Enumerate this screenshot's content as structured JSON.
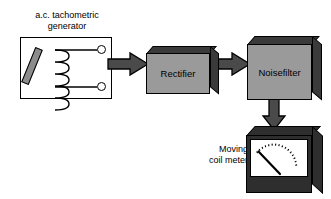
{
  "diagram": {
    "colors": {
      "block_fill": "#9a9a9a",
      "block_shadow": "#3a3a3a",
      "arrow_fill": "#4a4a4a",
      "outline": "#000000",
      "page_background": "#ffffff",
      "meter_bezel": "#2e2e2e",
      "rotor_fill": "#8c8c8c"
    },
    "nodes": [
      {
        "id": "generator",
        "label": "a.c. tachometric\ngenerator",
        "label_position": "above",
        "shape": "rectangle-outline",
        "contents": [
          "rotor-magnet",
          "coil-winding",
          "terminal-top",
          "terminal-bottom"
        ]
      },
      {
        "id": "rectifier",
        "label": "Rectifier",
        "shape": "block-3d"
      },
      {
        "id": "noise-filter",
        "label": "Noise\nfilter",
        "shape": "block-3d"
      },
      {
        "id": "moving-coil-meter",
        "label": "Moving\ncoil meter",
        "label_position": "left",
        "shape": "meter-3d",
        "scale_ticks": 21,
        "needle_value_fraction": 0.18
      }
    ],
    "connections": [
      {
        "from": "generator",
        "to": "rectifier",
        "direction": "right",
        "style": "block-arrow"
      },
      {
        "from": "rectifier",
        "to": "noise-filter",
        "direction": "right",
        "style": "block-arrow"
      },
      {
        "from": "noise-filter",
        "to": "moving-coil-meter",
        "direction": "down",
        "style": "block-arrow"
      }
    ]
  },
  "labels": {
    "generator_line1": "a.c. tachometric",
    "generator_line2": "generator",
    "rectifier": "Rectifier",
    "noise_line1": "Noise",
    "noise_line2": "filter",
    "meter_line1": "Moving",
    "meter_line2": "coil meter"
  }
}
